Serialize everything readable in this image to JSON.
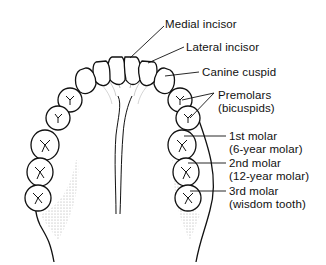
{
  "diagram": {
    "labels": [
      {
        "id": "medial-incisor",
        "line1": "Medial incisor",
        "line2": ""
      },
      {
        "id": "lateral-incisor",
        "line1": "Lateral incisor",
        "line2": ""
      },
      {
        "id": "canine-cuspid",
        "line1": "Canine cuspid",
        "line2": ""
      },
      {
        "id": "premolars",
        "line1": "Premolars",
        "line2": "(bicuspids)"
      },
      {
        "id": "first-molar",
        "line1": "1st molar",
        "line2": "(6-year molar)"
      },
      {
        "id": "second-molar",
        "line1": "2nd molar",
        "line2": "(12-year molar)"
      },
      {
        "id": "third-molar",
        "line1": "3rd molar",
        "line2": "(wisdom tooth)"
      }
    ],
    "colors": {
      "ink": "#111111",
      "background": "#ffffff",
      "shading": "#777777"
    }
  }
}
